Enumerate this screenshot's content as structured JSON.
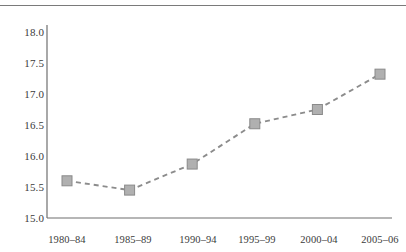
{
  "chart_data": {
    "type": "line",
    "title": "",
    "subtitle": "",
    "xlabel": "",
    "ylabel": "",
    "categories": [
      "1980–84",
      "1985–89",
      "1990–94",
      "1995–99",
      "2000–04",
      "2005–06"
    ],
    "values": [
      15.6,
      15.45,
      15.87,
      16.52,
      16.75,
      17.32
    ],
    "series": [
      {
        "name": "",
        "values": [
          15.6,
          15.45,
          15.87,
          16.52,
          16.75,
          17.32
        ]
      }
    ],
    "ylim": [
      15.0,
      18.0
    ],
    "yticks": [
      "15.0",
      "15.5",
      "16.0",
      "16.5",
      "17.0",
      "17.5",
      "18.0"
    ],
    "ytick_values": [
      15.0,
      15.5,
      16.0,
      16.5,
      17.0,
      17.5,
      18.0
    ],
    "xticks": [
      "1980–84",
      "1985–89",
      "1990–94",
      "1995–99",
      "2000–04",
      "2005–06"
    ],
    "grid": false,
    "legend": "none",
    "line_style": "dashed",
    "marker": "square",
    "colors": {
      "line": "#8c8c8c",
      "marker_fill": "#b0b0b0",
      "marker_edge": "#8a8a8a",
      "axis": "#6f6f6f",
      "text": "#3b3b3b",
      "rule": "#7a7a7a",
      "background": "#ffffff"
    }
  }
}
